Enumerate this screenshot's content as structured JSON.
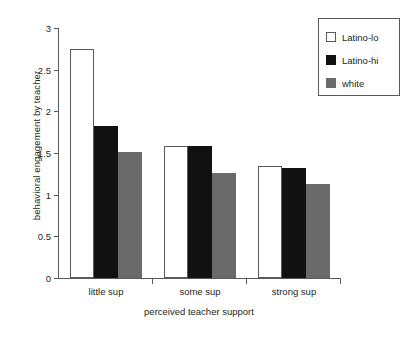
{
  "chart_data": {
    "type": "bar",
    "title": "",
    "xlabel": "perceived teacher support",
    "ylabel": "behavioral engagement by teacher",
    "categories": [
      "little sup",
      "some sup",
      "strong sup"
    ],
    "series": [
      {
        "name": "Latino-lo",
        "color": "#ffffff",
        "values": [
          2.75,
          1.59,
          1.34
        ]
      },
      {
        "name": "Latino-hi",
        "color": "#111111",
        "values": [
          1.83,
          1.58,
          1.32
        ]
      },
      {
        "name": "white",
        "color": "#6a6a6a",
        "values": [
          1.51,
          1.26,
          1.13
        ]
      }
    ],
    "ylim": [
      0,
      3
    ],
    "yticks": [
      0,
      0.5,
      1,
      1.5,
      2,
      2.5,
      3
    ],
    "ytick_labels": [
      "0",
      "0.5",
      "1",
      "1.5",
      "2",
      "2.5",
      "3"
    ],
    "grid": false,
    "legend_position": "top-right"
  },
  "legend": {
    "entries": [
      {
        "label": "Latino-lo"
      },
      {
        "label": "Latino-hi"
      },
      {
        "label": "white"
      }
    ]
  }
}
